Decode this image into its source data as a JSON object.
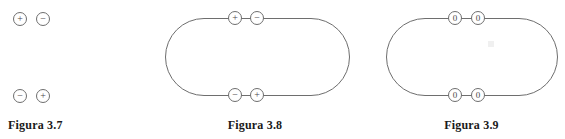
{
  "page": {
    "background_color": "#ffffff",
    "stroke_color": "#6e6e6e",
    "text_color": "#1a1a1a"
  },
  "figures": [
    {
      "id": "figura-3-7",
      "caption": "Figura 3.7",
      "has_outline": false,
      "charges": [
        {
          "symbol": "+",
          "kind": "positive",
          "row": "top",
          "position": "left"
        },
        {
          "symbol": "−",
          "kind": "negative",
          "row": "top",
          "position": "right"
        },
        {
          "symbol": "−",
          "kind": "negative",
          "row": "bottom",
          "position": "left"
        },
        {
          "symbol": "+",
          "kind": "positive",
          "row": "bottom",
          "position": "right"
        }
      ]
    },
    {
      "id": "figura-3-8",
      "caption": "Figura 3.8",
      "has_outline": true,
      "outline_shape": "stadium",
      "charges": [
        {
          "symbol": "+",
          "kind": "positive",
          "row": "top",
          "position": "left"
        },
        {
          "symbol": "−",
          "kind": "negative",
          "row": "top",
          "position": "right"
        },
        {
          "symbol": "−",
          "kind": "negative",
          "row": "bottom",
          "position": "left"
        },
        {
          "symbol": "+",
          "kind": "positive",
          "row": "bottom",
          "position": "right"
        }
      ]
    },
    {
      "id": "figura-3-9",
      "caption": "Figura 3.9",
      "has_outline": true,
      "outline_shape": "stadium",
      "charges": [
        {
          "symbol": "0",
          "kind": "neutral",
          "row": "top",
          "position": "left"
        },
        {
          "symbol": "0",
          "kind": "neutral",
          "row": "top",
          "position": "right"
        },
        {
          "symbol": "0",
          "kind": "neutral",
          "row": "bottom",
          "position": "left"
        },
        {
          "symbol": "0",
          "kind": "neutral",
          "row": "bottom",
          "position": "right"
        }
      ]
    }
  ]
}
